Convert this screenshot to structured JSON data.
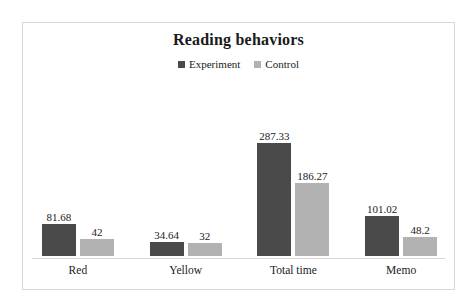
{
  "chart_data": {
    "type": "bar",
    "title": "Reading behaviors",
    "xlabel": "",
    "ylabel": "",
    "grid": false,
    "legend_position": "top-center",
    "ylim": [
      0,
      300
    ],
    "categories": [
      "Red",
      "Yellow",
      "Total time",
      "Memo"
    ],
    "series": [
      {
        "name": "Experiment",
        "color": "#4a4a4a",
        "values": [
          81.68,
          34.64,
          287.33,
          101.02
        ],
        "labels": [
          "81.68",
          "34.64",
          "287.33",
          "101.02"
        ]
      },
      {
        "name": "Control",
        "color": "#b2b2b2",
        "values": [
          42,
          32,
          186.27,
          48.2
        ],
        "labels": [
          "42",
          "32",
          "186.27",
          "48.2"
        ]
      }
    ]
  },
  "frame": {
    "border_color": "#d9d9d9",
    "axis_color": "#d6d6d6",
    "background": "#ffffff"
  }
}
